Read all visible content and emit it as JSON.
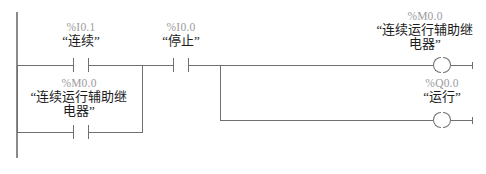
{
  "diagram": {
    "type": "ladder-logic",
    "language": "LAD",
    "rungs": [
      {
        "id": "rung-1",
        "contacts": [
          {
            "id": "contact-i01",
            "address": "%I0.1",
            "name": "“连续”",
            "kind": "normally-open"
          },
          {
            "id": "contact-i00",
            "address": "%I0.0",
            "name": "“停止”",
            "kind": "normally-open"
          }
        ],
        "coil": {
          "id": "coil-m00",
          "address": "%M0.0",
          "name_line1": "“连续运行辅助继",
          "name_line2": "电器”",
          "kind": "output-coil"
        }
      },
      {
        "id": "rung-2-branch",
        "contacts": [
          {
            "id": "contact-m00",
            "address": "%M0.0",
            "name_line1": "“连续运行辅助继",
            "name_line2": "电器”",
            "kind": "normally-open"
          }
        ],
        "coil": {
          "id": "coil-q00",
          "address": "%Q0.0",
          "name": "“运行”",
          "kind": "output-coil"
        }
      }
    ],
    "colors": {
      "wire": "#6f6f72",
      "rail": "#8a8a8d",
      "address_text": "#9b9b9e",
      "name_text": "#1c1c1c",
      "background": "#ffffff"
    }
  }
}
